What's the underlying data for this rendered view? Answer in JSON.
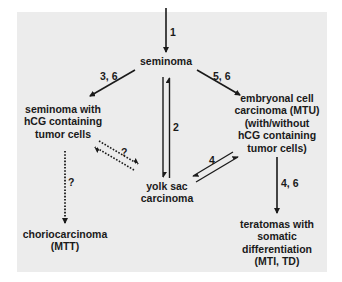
{
  "diagram": {
    "nodes": {
      "seminoma": "seminoma",
      "seminoma_hcg": "seminoma with\nhCG containing\ntumor cells",
      "embryonal": "embryonal cell\ncarcinoma (MTU)\n(with/without\nhCG containing\ntumor cells)",
      "yolk_sac": "yolk sac\ncarcinoma",
      "choriocarcinoma": "choriocarcinoma\n(MTT)",
      "teratomas": "teratomas with\nsomatic\ndifferentiation\n(MTI, TD)"
    },
    "edges": [
      {
        "from": "origin",
        "to": "seminoma",
        "label": "1",
        "style": "solid"
      },
      {
        "from": "seminoma",
        "to": "seminoma_hcg",
        "label": "3, 6",
        "style": "solid"
      },
      {
        "from": "seminoma",
        "to": "embryonal",
        "label": "5, 6",
        "style": "solid"
      },
      {
        "from": "seminoma",
        "to": "yolk_sac",
        "label": "2",
        "style": "solid-bidirectional"
      },
      {
        "from": "seminoma_hcg",
        "to": "yolk_sac",
        "label": "?",
        "style": "dotted-bidirectional"
      },
      {
        "from": "embryonal",
        "to": "yolk_sac",
        "label": "4",
        "style": "solid-bidirectional"
      },
      {
        "from": "seminoma_hcg",
        "to": "choriocarcinoma",
        "label": "?",
        "style": "dotted"
      },
      {
        "from": "embryonal",
        "to": "teratomas",
        "label": "4, 6",
        "style": "solid"
      }
    ],
    "colors": {
      "panel": "#ececec",
      "ink": "#1a1a1a"
    }
  }
}
